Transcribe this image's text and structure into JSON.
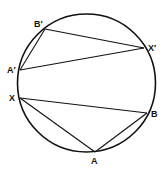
{
  "diagram": {
    "type": "geometry-circle-chords",
    "circle": {
      "cx": 86.5,
      "cy": 83,
      "r": 69
    },
    "stroke_color": "#111111",
    "points": [
      {
        "id": "B_prime",
        "label": "B′",
        "x": 45,
        "y": 29,
        "lx": 34,
        "ly": 27
      },
      {
        "id": "X_prime",
        "label": "X′",
        "x": 144,
        "y": 48,
        "lx": 148,
        "ly": 51
      },
      {
        "id": "A_prime",
        "label": "A′",
        "x": 20,
        "y": 70,
        "lx": 7,
        "ly": 73
      },
      {
        "id": "X",
        "label": "X",
        "x": 20,
        "y": 98,
        "lx": 9,
        "ly": 101
      },
      {
        "id": "B",
        "label": "B",
        "x": 147,
        "y": 113,
        "lx": 151,
        "ly": 117
      },
      {
        "id": "A",
        "label": "A",
        "x": 95,
        "y": 152,
        "lx": 91,
        "ly": 164
      }
    ],
    "segments": [
      [
        "B_prime",
        "X_prime"
      ],
      [
        "X_prime",
        "A_prime"
      ],
      [
        "A_prime",
        "B_prime"
      ],
      [
        "X",
        "B"
      ],
      [
        "B",
        "A"
      ],
      [
        "A",
        "X"
      ]
    ]
  }
}
